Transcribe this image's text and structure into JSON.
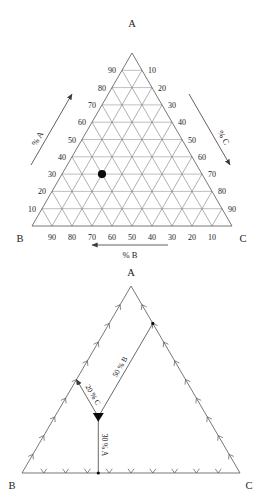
{
  "figures": [
    {
      "id": "ternary-grid-diagram",
      "vertices": {
        "top": "A",
        "bottom_left": "B",
        "bottom_right": "C"
      },
      "axis_titles": {
        "left": "% A",
        "right": "% C",
        "bottom": "% B"
      },
      "tick_values": [
        10,
        20,
        30,
        40,
        50,
        60,
        70,
        80,
        90
      ],
      "left_axis_labels": [
        90,
        80,
        70,
        60,
        50,
        40,
        30,
        20,
        10
      ],
      "right_axis_labels": [
        10,
        20,
        30,
        40,
        50,
        60,
        70,
        80,
        90
      ],
      "bottom_axis_labels": [
        90,
        80,
        70,
        60,
        50,
        40,
        30,
        20,
        10
      ],
      "bottom_arrow_direction": "left",
      "left_arrow_direction": "up-right",
      "right_arrow_direction": "down-right",
      "point": {
        "A": 30,
        "B": 50,
        "C": 20,
        "marker": "filled-circle"
      }
    },
    {
      "id": "ternary-construction-diagram",
      "vertices": {
        "top": "A",
        "bottom_left": "B",
        "bottom_right": "C"
      },
      "edge_tick_count": 9,
      "point": {
        "A": 30,
        "B": 50,
        "C": 20,
        "marker": "filled-circle"
      },
      "callouts": [
        {
          "label": "20 % C",
          "from": "point",
          "to": "left-edge"
        },
        {
          "label": "50 % B",
          "from": "point",
          "to": "right-edge"
        },
        {
          "label": "30 % A",
          "from": "point",
          "to": "bottom-edge"
        }
      ]
    }
  ],
  "chart_data": {
    "type": "scatter",
    "title": "",
    "subtype": "ternary",
    "axes": {
      "A": "% A",
      "B": "% B",
      "C": "% C"
    },
    "axis_ranges": {
      "A": [
        0,
        100
      ],
      "B": [
        0,
        100
      ],
      "C": [
        0,
        100
      ]
    },
    "tick_labels": [
      10,
      20,
      30,
      40,
      50,
      60,
      70,
      80,
      90
    ],
    "grid": true,
    "legend": "none",
    "points": [
      {
        "name": "sample point",
        "A": 30,
        "B": 50,
        "C": 20
      }
    ],
    "annotations": [
      "20 % C",
      "50 % B",
      "30 % A"
    ]
  },
  "colors": {
    "background": "#ffffff",
    "grid": "#6e6e6e",
    "outline": "#555555",
    "text": "#1a1a1a",
    "point": "#0b0b0b"
  }
}
